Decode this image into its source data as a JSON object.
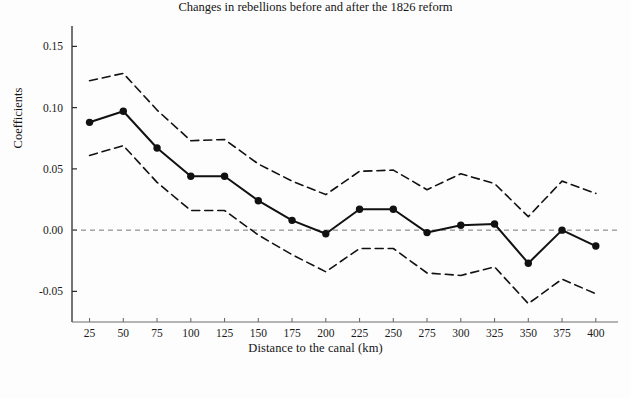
{
  "chart_data": {
    "type": "line",
    "title": "",
    "caption": "Changes in rebellions before and after the 1826 reform",
    "xlabel": "Distance to the canal (km)",
    "ylabel": "Coefficients",
    "x": [
      25,
      50,
      75,
      100,
      125,
      150,
      175,
      200,
      225,
      250,
      275,
      300,
      325,
      350,
      375,
      400
    ],
    "xtick_labels": [
      "25",
      "50",
      "75",
      "100",
      "125",
      "150",
      "175",
      "200",
      "225",
      "250",
      "275",
      "300",
      "325",
      "350",
      "375",
      "400"
    ],
    "ytick_labels": [
      "0.15",
      "0.10",
      "0.05",
      "0.00",
      "-0.05"
    ],
    "yticks": [
      0.15,
      0.1,
      0.05,
      0.0,
      -0.05
    ],
    "ylim": [
      -0.075,
      0.165
    ],
    "xlim": [
      12,
      412
    ],
    "grid": false,
    "legend": null,
    "zero_reference_line": 0.0,
    "series": [
      {
        "name": "Coefficient",
        "style": "solid-with-markers",
        "color": "#111111",
        "values": [
          0.088,
          0.097,
          0.067,
          0.044,
          0.044,
          0.024,
          0.008,
          -0.003,
          0.017,
          0.017,
          -0.002,
          0.004,
          0.005,
          -0.027,
          0.0,
          -0.013
        ]
      },
      {
        "name": "Upper confidence bound",
        "style": "dashed",
        "color": "#111111",
        "values": [
          0.122,
          0.128,
          0.098,
          0.073,
          0.074,
          0.054,
          0.04,
          0.029,
          0.048,
          0.049,
          0.033,
          0.046,
          0.038,
          0.011,
          0.04,
          0.03
        ]
      },
      {
        "name": "Lower confidence bound",
        "style": "dashed",
        "color": "#111111",
        "values": [
          0.061,
          0.069,
          0.039,
          0.016,
          0.016,
          -0.004,
          -0.02,
          -0.034,
          -0.015,
          -0.015,
          -0.035,
          -0.037,
          -0.03,
          -0.06,
          -0.04,
          -0.052
        ]
      }
    ]
  },
  "figure": {
    "xlabel": "Distance to the canal (km)",
    "ylabel": "Coefficients",
    "caption": "Changes in rebellions before and after the 1826 reform"
  }
}
